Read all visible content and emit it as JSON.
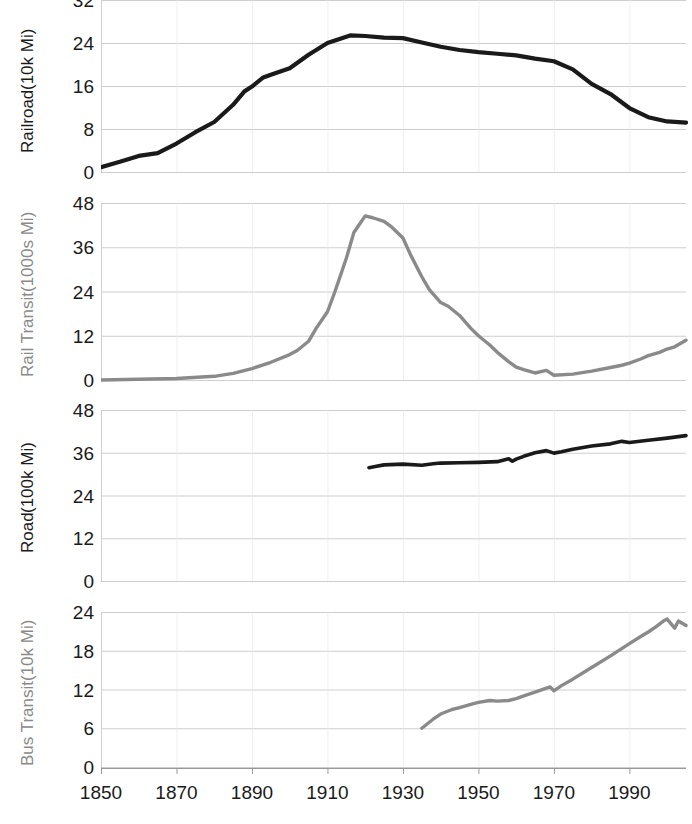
{
  "chart_data": {
    "type": "line",
    "title": "",
    "xlabel": "",
    "xlim": [
      1850,
      2005
    ],
    "grid": true,
    "legend": "none",
    "xticks": [
      1850,
      1870,
      1890,
      1910,
      1930,
      1950,
      1970,
      1990
    ],
    "xtick_labels": [
      "1850",
      "1870",
      "1890",
      "1910",
      "1930",
      "1950",
      "1970",
      "1990"
    ],
    "panels": [
      {
        "id": "railroad",
        "ylabel_line1": "Railroad",
        "ylabel_line2": "(10k Mi)",
        "ylabel": "Railroad (10k Mi)",
        "color": "#1a1a1a",
        "ylim": [
          0,
          32
        ],
        "yticks": [
          0,
          8,
          16,
          24,
          32
        ],
        "ytick_labels": [
          "0",
          "8",
          "16",
          "24",
          "32"
        ],
        "x": [
          1850,
          1855,
          1860,
          1865,
          1870,
          1875,
          1880,
          1885,
          1888,
          1890,
          1893,
          1895,
          1900,
          1905,
          1910,
          1916,
          1920,
          1925,
          1930,
          1935,
          1940,
          1945,
          1950,
          1955,
          1960,
          1965,
          1970,
          1975,
          1980,
          1985,
          1990,
          1995,
          2000,
          2005
        ],
        "y": [
          0.9,
          1.9,
          3.0,
          3.5,
          5.3,
          7.4,
          9.3,
          12.5,
          15.0,
          15.9,
          17.6,
          18.1,
          19.3,
          21.8,
          24.0,
          25.4,
          25.3,
          25.0,
          24.9,
          24.1,
          23.3,
          22.7,
          22.3,
          22.0,
          21.7,
          21.1,
          20.6,
          19.1,
          16.4,
          14.5,
          11.9,
          10.2,
          9.4,
          9.2
        ]
      },
      {
        "id": "rail-transit",
        "ylabel_line1": "Rail Transit",
        "ylabel_line2": "(1000s Mi)",
        "ylabel": "Rail Transit (1000s Mi)",
        "color": "#8a8a8a",
        "ylim": [
          0,
          48
        ],
        "yticks": [
          0,
          12,
          24,
          36,
          48
        ],
        "ytick_labels": [
          "0",
          "12",
          "24",
          "36",
          "48"
        ],
        "x": [
          1850,
          1860,
          1870,
          1880,
          1885,
          1890,
          1895,
          1900,
          1902,
          1905,
          1907,
          1910,
          1912,
          1915,
          1917,
          1918,
          1920,
          1922,
          1925,
          1927,
          1930,
          1932,
          1935,
          1937,
          1940,
          1942,
          1945,
          1948,
          1950,
          1953,
          1955,
          1958,
          1960,
          1962,
          1965,
          1968,
          1970,
          1975,
          1980,
          1985,
          1988,
          1990,
          1993,
          1995,
          1998,
          2000,
          2002,
          2005
        ],
        "y": [
          0.0,
          0.2,
          0.4,
          1.0,
          1.8,
          3.1,
          4.8,
          6.9,
          8.0,
          10.5,
          14.0,
          18.5,
          24.0,
          33.0,
          40.0,
          41.5,
          44.5,
          44.0,
          43.0,
          41.5,
          38.5,
          34.0,
          28.0,
          24.5,
          21.0,
          20.0,
          17.5,
          14.0,
          12.0,
          9.5,
          7.5,
          5.0,
          3.5,
          2.8,
          1.9,
          2.6,
          1.3,
          1.6,
          2.4,
          3.4,
          4.0,
          4.6,
          5.7,
          6.6,
          7.5,
          8.4,
          9.0,
          10.8
        ]
      },
      {
        "id": "road",
        "ylabel_line1": "Road",
        "ylabel_line2": "(100k Mi)",
        "ylabel": "Road (100k Mi)",
        "color": "#1a1a1a",
        "ylim": [
          0,
          48
        ],
        "yticks": [
          0,
          12,
          24,
          36,
          48
        ],
        "ytick_labels": [
          "0",
          "12",
          "24",
          "36",
          "48"
        ],
        "x": [
          1921,
          1923,
          1925,
          1930,
          1935,
          1938,
          1940,
          1945,
          1950,
          1955,
          1958,
          1959,
          1960,
          1962,
          1965,
          1968,
          1970,
          1972,
          1975,
          1980,
          1985,
          1988,
          1990,
          1995,
          2000,
          2005
        ],
        "y": [
          31.8,
          32.2,
          32.6,
          32.8,
          32.5,
          32.9,
          33.1,
          33.2,
          33.3,
          33.5,
          34.3,
          33.6,
          34.2,
          35.0,
          36.0,
          36.6,
          35.9,
          36.3,
          37.0,
          37.9,
          38.5,
          39.2,
          38.9,
          39.5,
          40.1,
          40.8
        ]
      },
      {
        "id": "bus-transit",
        "ylabel_line1": "Bus Transit",
        "ylabel_line2": "(10k Mi)",
        "ylabel": "Bus Transit (10k Mi)",
        "color": "#8a8a8a",
        "ylim": [
          0,
          24
        ],
        "yticks": [
          0,
          6,
          12,
          18,
          24
        ],
        "ytick_labels": [
          "0",
          "6",
          "12",
          "18",
          "24"
        ],
        "x": [
          1935,
          1938,
          1940,
          1943,
          1945,
          1948,
          1950,
          1953,
          1955,
          1958,
          1960,
          1963,
          1965,
          1968,
          1969,
          1970,
          1972,
          1975,
          1980,
          1985,
          1990,
          1993,
          1995,
          1997,
          1999,
          2000,
          2002,
          2003,
          2005
        ],
        "y": [
          6.0,
          7.4,
          8.2,
          8.9,
          9.2,
          9.7,
          10.0,
          10.3,
          10.2,
          10.3,
          10.6,
          11.2,
          11.6,
          12.2,
          12.4,
          11.8,
          12.6,
          13.6,
          15.4,
          17.2,
          19.1,
          20.2,
          20.9,
          21.7,
          22.6,
          22.9,
          21.5,
          22.6,
          21.9
        ]
      }
    ]
  }
}
